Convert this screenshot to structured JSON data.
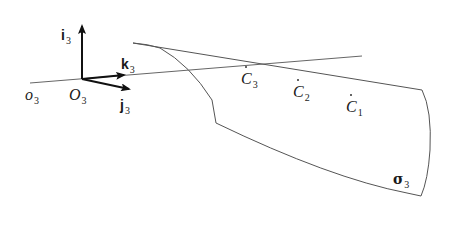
{
  "diagram": {
    "labels": {
      "i3": {
        "main": "i",
        "sub": "3"
      },
      "k3": {
        "main": "k",
        "sub": "3"
      },
      "j3": {
        "main": "j",
        "sub": "3"
      },
      "o3": {
        "main": "o",
        "sub": "3"
      },
      "O3": {
        "main": "O",
        "sub": "3"
      },
      "C3": {
        "main": "C",
        "sub": "3"
      },
      "C2": {
        "main": "C",
        "sub": "2"
      },
      "C1": {
        "main": "C",
        "sub": "1"
      },
      "sigma3": {
        "main": "σ",
        "sub": "3"
      }
    },
    "colors": {
      "line": "#555555",
      "arrow": "#111111",
      "text": "#1a1a1a"
    }
  }
}
